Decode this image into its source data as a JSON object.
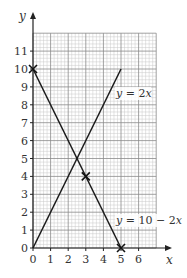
{
  "chart_data": {
    "type": "line",
    "title": "",
    "xlabel": "x",
    "ylabel": "y",
    "xlim": [
      0,
      7
    ],
    "ylim": [
      0,
      12
    ],
    "grid": true,
    "grid_minor_per_unit": 5,
    "x_ticks": [
      "0",
      "1",
      "2",
      "3",
      "4",
      "5",
      "6"
    ],
    "y_ticks": [
      "0",
      "1",
      "2",
      "3",
      "4",
      "5",
      "6",
      "7",
      "8",
      "9",
      "10",
      "11"
    ],
    "series": [
      {
        "name": "y = 2x",
        "points": [
          [
            0,
            0
          ],
          [
            5,
            10
          ]
        ],
        "label": "y = 2x",
        "label_pos": [
          4.8,
          8.6
        ]
      },
      {
        "name": "y = 10 - 2x",
        "points": [
          [
            0,
            10
          ],
          [
            5,
            0
          ]
        ],
        "label": "y = 10 − 2x",
        "label_pos": [
          4.8,
          1.5
        ]
      }
    ],
    "markers": [
      {
        "x": 0,
        "y": 10,
        "symbol": "cross"
      },
      {
        "x": 3,
        "y": 4,
        "symbol": "cross"
      },
      {
        "x": 5,
        "y": 0,
        "symbol": "cross"
      }
    ],
    "intersection": {
      "x": 2.5,
      "y": 5
    }
  },
  "labels": {
    "x_axis": "x",
    "y_axis": "y",
    "eq1_prefix": "y",
    "eq1_rest": " = 2",
    "eq1_var": "x",
    "eq2_prefix": "y",
    "eq2_rest": " = 10 − 2",
    "eq2_var": "x"
  }
}
